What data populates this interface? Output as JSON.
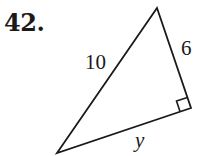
{
  "problem": {
    "number": "42."
  },
  "figure": {
    "type": "right-triangle",
    "stroke_color": "#1a1a1a",
    "vertices": {
      "top": [
        157,
        8
      ],
      "right_angle": [
        191,
        108
      ],
      "bottom_left": [
        57,
        153
      ]
    },
    "labels": {
      "hypotenuse": "10",
      "leg_vertical": "6",
      "leg_bottom": "y"
    },
    "right_angle_marker": true
  }
}
